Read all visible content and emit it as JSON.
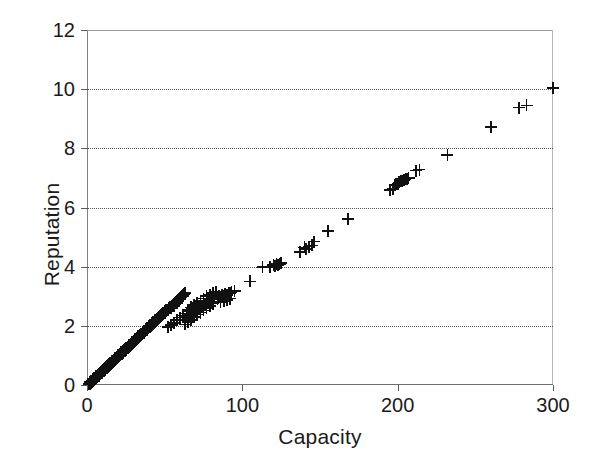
{
  "chart_data": {
    "type": "scatter",
    "title": "",
    "xlabel": "Capacity",
    "ylabel": "Reputation",
    "xlim": [
      0,
      300
    ],
    "ylim": [
      0,
      12
    ],
    "xticks": [
      0,
      100,
      200,
      300
    ],
    "yticks": [
      0,
      2,
      4,
      6,
      8,
      10,
      12
    ],
    "grid": "horizontal-dotted",
    "legend": "none",
    "marker": "plus",
    "marker_color": "#111111",
    "series": [
      {
        "name": "Reputation vs Capacity",
        "points": [
          [
            1,
            0.02
          ],
          [
            1.5,
            0.04
          ],
          [
            2,
            0.05
          ],
          [
            2,
            0.1
          ],
          [
            2.5,
            0.07
          ],
          [
            3,
            0.09
          ],
          [
            3,
            0.14
          ],
          [
            3.5,
            0.12
          ],
          [
            4,
            0.15
          ],
          [
            4,
            0.2
          ],
          [
            4.5,
            0.17
          ],
          [
            5,
            0.19
          ],
          [
            5,
            0.24
          ],
          [
            5.5,
            0.22
          ],
          [
            6,
            0.25
          ],
          [
            6,
            0.3
          ],
          [
            6.5,
            0.27
          ],
          [
            7,
            0.29
          ],
          [
            7,
            0.34
          ],
          [
            7.5,
            0.32
          ],
          [
            8,
            0.35
          ],
          [
            8,
            0.4
          ],
          [
            8.5,
            0.37
          ],
          [
            9,
            0.39
          ],
          [
            9,
            0.44
          ],
          [
            9.5,
            0.42
          ],
          [
            10,
            0.45
          ],
          [
            10,
            0.5
          ],
          [
            10.5,
            0.47
          ],
          [
            11,
            0.49
          ],
          [
            11,
            0.54
          ],
          [
            11.5,
            0.52
          ],
          [
            12,
            0.55
          ],
          [
            12,
            0.6
          ],
          [
            12.5,
            0.57
          ],
          [
            13,
            0.59
          ],
          [
            13,
            0.64
          ],
          [
            13.5,
            0.62
          ],
          [
            14,
            0.65
          ],
          [
            14,
            0.7
          ],
          [
            14.5,
            0.67
          ],
          [
            15,
            0.69
          ],
          [
            15,
            0.74
          ],
          [
            15.5,
            0.72
          ],
          [
            16,
            0.75
          ],
          [
            16,
            0.8
          ],
          [
            16.5,
            0.77
          ],
          [
            17,
            0.79
          ],
          [
            17,
            0.84
          ],
          [
            17.5,
            0.82
          ],
          [
            18,
            0.85
          ],
          [
            18,
            0.9
          ],
          [
            18.5,
            0.87
          ],
          [
            19,
            0.89
          ],
          [
            19,
            0.94
          ],
          [
            19.5,
            0.92
          ],
          [
            20,
            0.95
          ],
          [
            20,
            1.0
          ],
          [
            20.5,
            0.97
          ],
          [
            21,
            0.99
          ],
          [
            21,
            1.04
          ],
          [
            21.5,
            1.02
          ],
          [
            22,
            1.05
          ],
          [
            22,
            1.1
          ],
          [
            22.5,
            1.07
          ],
          [
            23,
            1.09
          ],
          [
            23,
            1.14
          ],
          [
            23.5,
            1.12
          ],
          [
            24,
            1.15
          ],
          [
            24,
            1.2
          ],
          [
            24.5,
            1.17
          ],
          [
            25,
            1.19
          ],
          [
            25,
            1.24
          ],
          [
            25.5,
            1.22
          ],
          [
            26,
            1.25
          ],
          [
            26,
            1.3
          ],
          [
            26.5,
            1.27
          ],
          [
            27,
            1.29
          ],
          [
            27,
            1.34
          ],
          [
            27.5,
            1.32
          ],
          [
            28,
            1.35
          ],
          [
            28,
            1.4
          ],
          [
            28.5,
            1.37
          ],
          [
            29,
            1.39
          ],
          [
            29,
            1.44
          ],
          [
            29.5,
            1.42
          ],
          [
            30,
            1.45
          ],
          [
            30,
            1.5
          ],
          [
            30.5,
            1.47
          ],
          [
            31,
            1.49
          ],
          [
            31,
            1.54
          ],
          [
            31.5,
            1.52
          ],
          [
            32,
            1.55
          ],
          [
            32,
            1.6
          ],
          [
            32.5,
            1.57
          ],
          [
            33,
            1.59
          ],
          [
            33,
            1.64
          ],
          [
            33.5,
            1.62
          ],
          [
            34,
            1.65
          ],
          [
            34,
            1.7
          ],
          [
            34.5,
            1.67
          ],
          [
            35,
            1.69
          ],
          [
            35,
            1.74
          ],
          [
            35.5,
            1.72
          ],
          [
            36,
            1.75
          ],
          [
            36,
            1.8
          ],
          [
            36.5,
            1.77
          ],
          [
            37,
            1.79
          ],
          [
            37,
            1.84
          ],
          [
            37.5,
            1.82
          ],
          [
            38,
            1.85
          ],
          [
            38,
            1.9
          ],
          [
            38.5,
            1.87
          ],
          [
            39,
            1.89
          ],
          [
            39,
            1.94
          ],
          [
            39.5,
            1.92
          ],
          [
            40,
            1.95
          ],
          [
            40,
            2.0
          ],
          [
            40.5,
            1.97
          ],
          [
            41,
            1.99
          ],
          [
            41,
            2.04
          ],
          [
            41.5,
            2.02
          ],
          [
            42,
            2.05
          ],
          [
            42,
            2.1
          ],
          [
            42.5,
            2.07
          ],
          [
            43,
            2.09
          ],
          [
            43,
            2.14
          ],
          [
            43.5,
            2.12
          ],
          [
            44,
            2.15
          ],
          [
            44,
            2.2
          ],
          [
            44.5,
            2.17
          ],
          [
            45,
            2.19
          ],
          [
            45,
            2.24
          ],
          [
            45.5,
            2.22
          ],
          [
            46,
            2.25
          ],
          [
            46,
            2.3
          ],
          [
            46.5,
            2.27
          ],
          [
            47,
            2.29
          ],
          [
            47,
            2.34
          ],
          [
            47.5,
            2.32
          ],
          [
            48,
            2.35
          ],
          [
            48,
            2.4
          ],
          [
            48.5,
            2.37
          ],
          [
            49,
            2.39
          ],
          [
            49,
            2.44
          ],
          [
            49.5,
            2.42
          ],
          [
            50,
            2.45
          ],
          [
            50,
            2.5
          ],
          [
            50.5,
            2.47
          ],
          [
            51,
            2.49
          ],
          [
            51,
            2.54
          ],
          [
            52,
            2.55
          ],
          [
            52.5,
            2.57
          ],
          [
            53,
            2.6
          ],
          [
            53.5,
            2.62
          ],
          [
            54,
            2.65
          ],
          [
            54.5,
            2.67
          ],
          [
            55,
            2.7
          ],
          [
            55.5,
            2.72
          ],
          [
            56,
            2.75
          ],
          [
            56.5,
            2.77
          ],
          [
            57,
            2.8
          ],
          [
            57.5,
            2.82
          ],
          [
            58,
            2.85
          ],
          [
            58.5,
            2.87
          ],
          [
            59,
            2.9
          ],
          [
            59.5,
            2.92
          ],
          [
            60,
            2.95
          ],
          [
            60.5,
            2.97
          ],
          [
            61,
            3.0
          ],
          [
            61.5,
            3.02
          ],
          [
            62,
            3.05
          ],
          [
            62.5,
            3.07
          ],
          [
            63,
            3.1
          ],
          [
            54,
            2.6
          ],
          [
            56,
            2.68
          ],
          [
            58,
            2.78
          ],
          [
            60,
            2.9
          ],
          [
            62,
            3.0
          ],
          [
            52,
            1.95
          ],
          [
            54,
            2.02
          ],
          [
            56,
            2.1
          ],
          [
            58,
            2.2
          ],
          [
            60,
            2.28
          ],
          [
            62,
            2.35
          ],
          [
            64,
            2.42
          ],
          [
            66,
            2.5
          ],
          [
            68,
            2.58
          ],
          [
            70,
            2.65
          ],
          [
            63,
            2.05
          ],
          [
            65,
            2.12
          ],
          [
            67,
            2.2
          ],
          [
            69,
            2.3
          ],
          [
            71,
            2.38
          ],
          [
            73,
            2.45
          ],
          [
            75,
            2.52
          ],
          [
            77,
            2.6
          ],
          [
            79,
            2.68
          ],
          [
            81,
            2.75
          ],
          [
            64,
            2.3
          ],
          [
            66,
            2.38
          ],
          [
            68,
            2.45
          ],
          [
            70,
            2.52
          ],
          [
            72,
            2.6
          ],
          [
            74,
            2.68
          ],
          [
            76,
            2.75
          ],
          [
            78,
            2.82
          ],
          [
            80,
            2.9
          ],
          [
            82,
            2.98
          ],
          [
            65,
            2.55
          ],
          [
            67,
            2.62
          ],
          [
            69,
            2.7
          ],
          [
            71,
            2.78
          ],
          [
            73,
            2.85
          ],
          [
            75,
            2.92
          ],
          [
            77,
            3.0
          ],
          [
            79,
            3.05
          ],
          [
            81,
            3.1
          ],
          [
            83,
            3.15
          ],
          [
            84,
            2.9
          ],
          [
            86,
            2.95
          ],
          [
            88,
            3.0
          ],
          [
            90,
            3.05
          ],
          [
            92,
            3.1
          ],
          [
            85,
            3.0
          ],
          [
            87,
            3.05
          ],
          [
            89,
            3.08
          ],
          [
            91,
            3.12
          ],
          [
            93,
            3.15
          ],
          [
            95,
            3.18
          ],
          [
            86,
            2.8
          ],
          [
            88,
            2.85
          ],
          [
            90,
            2.88
          ],
          [
            92,
            2.92
          ],
          [
            105,
            3.5
          ],
          [
            113,
            3.98
          ],
          [
            118,
            4.0
          ],
          [
            120,
            4.05
          ],
          [
            121,
            4.02
          ],
          [
            122,
            4.08
          ],
          [
            123,
            4.05
          ],
          [
            124,
            4.1
          ],
          [
            125,
            4.12
          ],
          [
            137,
            4.5
          ],
          [
            140,
            4.65
          ],
          [
            141,
            4.6
          ],
          [
            143,
            4.68
          ],
          [
            145,
            4.72
          ],
          [
            146,
            4.85
          ],
          [
            155,
            5.2
          ],
          [
            168,
            5.62
          ],
          [
            195,
            6.6
          ],
          [
            197,
            6.62
          ],
          [
            198,
            6.75
          ],
          [
            199,
            6.78
          ],
          [
            200,
            6.8
          ],
          [
            201,
            6.85
          ],
          [
            202,
            6.88
          ],
          [
            203,
            6.9
          ],
          [
            204,
            6.92
          ],
          [
            205,
            6.95
          ],
          [
            206,
            6.98
          ],
          [
            207,
            7.0
          ],
          [
            212,
            7.25
          ],
          [
            214,
            7.28
          ],
          [
            232,
            7.78
          ],
          [
            260,
            8.72
          ],
          [
            278,
            9.38
          ],
          [
            283,
            9.45
          ],
          [
            300,
            10.05
          ]
        ]
      }
    ]
  },
  "axes": {
    "x": {
      "label": "Capacity",
      "ticks": [
        "0",
        "100",
        "200",
        "300"
      ]
    },
    "y": {
      "label": "Reputation",
      "ticks": [
        "0",
        "2",
        "4",
        "6",
        "8",
        "10",
        "12"
      ]
    }
  }
}
